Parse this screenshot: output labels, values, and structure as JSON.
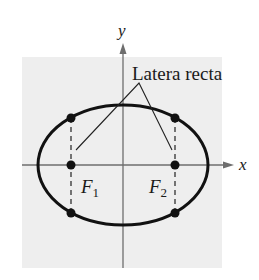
{
  "figure": {
    "background_color": "#ffffff",
    "panel_color": "#eeeeee",
    "axis_color": "#6e6e6e",
    "curve_color": "#111111",
    "x_axis_label": "x",
    "y_axis_label": "y",
    "annotation": "Latera recta",
    "foci": [
      {
        "name": "F",
        "subscript": "1"
      },
      {
        "name": "F",
        "subscript": "2"
      }
    ],
    "geometry": {
      "panel": {
        "x": 22,
        "y": 57,
        "width": 200,
        "height": 211
      },
      "center": {
        "x": 123,
        "y": 165
      },
      "semi_major": 85,
      "semi_minor": 60,
      "focus_1_x": 71,
      "focus_2_x": 175,
      "latus_top_y": 118,
      "latus_bottom_y": 213
    }
  }
}
